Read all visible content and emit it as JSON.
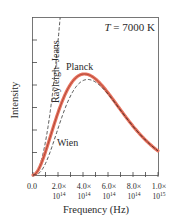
{
  "chart_data": {
    "type": "line",
    "title": "",
    "annotation": "T = 7000 K",
    "annotation_var": "T",
    "annotation_rest": " = 7000 K",
    "temperature_K": 7000,
    "xlabel": "Frequency (Hz)",
    "ylabel": "Intensity",
    "xlim": [
      0,
      1000000000000000.0
    ],
    "ylim": [
      0,
      6.9
    ],
    "grid": false,
    "legend": "inline labels",
    "x_ticks": [
      {
        "value": 0,
        "line1": "0.0",
        "line2": ""
      },
      {
        "value": 200000000000000.0,
        "line1": "2.0×",
        "line2": "10",
        "exp": "14"
      },
      {
        "value": 400000000000000.0,
        "line1": "4.0×",
        "line2": "10",
        "exp": "14"
      },
      {
        "value": 600000000000000.0,
        "line1": "6.0×",
        "line2": "10",
        "exp": "14"
      },
      {
        "value": 800000000000000.0,
        "line1": "8.0×",
        "line2": "10",
        "exp": "14"
      },
      {
        "value": 1000000000000000.0,
        "line1": "1.0×",
        "line2": "10",
        "exp": "15"
      }
    ],
    "minor_x_ticks_per_major": 1,
    "y_ticks_count": 6,
    "series": [
      {
        "name": "Rayleigh–Jeans",
        "style": "dashed",
        "color": "#2a2a2a",
        "x": [
          0,
          50000000000000.0,
          100000000000000.0,
          150000000000000.0,
          200000000000000.0,
          217000000000000.0
        ],
        "values": [
          0,
          0.36,
          1.46,
          3.28,
          5.83,
          6.9
        ]
      },
      {
        "name": "Planck",
        "style": "solid-thick",
        "color": "#e8735f",
        "x": [
          0,
          100000000000000.0,
          200000000000000.0,
          300000000000000.0,
          400000000000000.0,
          410000000000000.0,
          500000000000000.0,
          600000000000000.0,
          700000000000000.0,
          800000000000000.0,
          900000000000000.0,
          1000000000000000.0
        ],
        "values": [
          0,
          1.01,
          2.95,
          4.1,
          4.41,
          4.41,
          4.17,
          3.55,
          2.8,
          2.08,
          1.49,
          1.05
        ]
      },
      {
        "name": "Wien",
        "style": "dashed",
        "color": "#2a2a2a",
        "x": [
          0,
          100000000000000.0,
          200000000000000.0,
          300000000000000.0,
          400000000000000.0,
          410000000000000.0,
          500000000000000.0,
          600000000000000.0,
          700000000000000.0,
          800000000000000.0,
          900000000000000.0,
          1000000000000000.0
        ],
        "values": [
          0,
          0.5,
          2.03,
          3.45,
          4.15,
          4.14,
          4.05,
          3.52,
          2.79,
          2.07,
          1.47,
          1.05
        ]
      }
    ],
    "labels": {
      "rayleigh_jeans": "Rayleigh–Jeans",
      "planck": "Planck",
      "wien": "Wien"
    }
  }
}
